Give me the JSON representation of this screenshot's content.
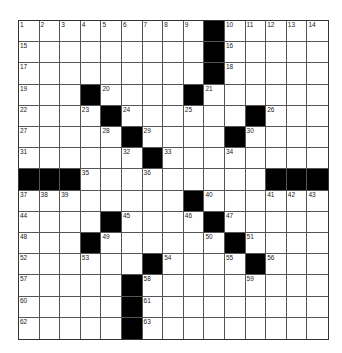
{
  "puzzle": {
    "rows": 15,
    "cols": 15,
    "colors": {
      "black": "#000000",
      "white": "#ffffff",
      "line": "#555555"
    },
    "black_cells": [
      [
        0,
        9
      ],
      [
        1,
        9
      ],
      [
        2,
        9
      ],
      [
        3,
        3
      ],
      [
        3,
        8
      ],
      [
        4,
        4
      ],
      [
        4,
        11
      ],
      [
        5,
        5
      ],
      [
        5,
        10
      ],
      [
        6,
        6
      ],
      [
        7,
        0
      ],
      [
        7,
        1
      ],
      [
        7,
        2
      ],
      [
        7,
        12
      ],
      [
        7,
        13
      ],
      [
        7,
        14
      ],
      [
        8,
        8
      ],
      [
        9,
        4
      ],
      [
        9,
        9
      ],
      [
        10,
        3
      ],
      [
        10,
        10
      ],
      [
        11,
        6
      ],
      [
        11,
        11
      ],
      [
        12,
        5
      ],
      [
        13,
        5
      ],
      [
        14,
        5
      ]
    ],
    "numbers": [
      [
        0,
        0,
        "1"
      ],
      [
        0,
        1,
        "2"
      ],
      [
        0,
        2,
        "3"
      ],
      [
        0,
        3,
        "4"
      ],
      [
        0,
        4,
        "5"
      ],
      [
        0,
        5,
        "6"
      ],
      [
        0,
        6,
        "7"
      ],
      [
        0,
        7,
        "8"
      ],
      [
        0,
        8,
        "9"
      ],
      [
        0,
        10,
        "10"
      ],
      [
        0,
        11,
        "11"
      ],
      [
        0,
        12,
        "12"
      ],
      [
        0,
        13,
        "13"
      ],
      [
        0,
        14,
        "14"
      ],
      [
        1,
        0,
        "15"
      ],
      [
        1,
        10,
        "16"
      ],
      [
        2,
        0,
        "17"
      ],
      [
        2,
        10,
        "18"
      ],
      [
        3,
        0,
        "19"
      ],
      [
        3,
        4,
        "20"
      ],
      [
        3,
        9,
        "21"
      ],
      [
        4,
        0,
        "22"
      ],
      [
        4,
        3,
        "23"
      ],
      [
        4,
        5,
        "24"
      ],
      [
        4,
        8,
        "25"
      ],
      [
        4,
        12,
        "26"
      ],
      [
        5,
        0,
        "27"
      ],
      [
        5,
        4,
        "28"
      ],
      [
        5,
        6,
        "29"
      ],
      [
        5,
        11,
        "30"
      ],
      [
        6,
        0,
        "31"
      ],
      [
        6,
        5,
        "32"
      ],
      [
        6,
        7,
        "33"
      ],
      [
        6,
        10,
        "34"
      ],
      [
        7,
        3,
        "35"
      ],
      [
        7,
        6,
        "36"
      ],
      [
        8,
        0,
        "37"
      ],
      [
        8,
        1,
        "38"
      ],
      [
        8,
        2,
        "39"
      ],
      [
        8,
        9,
        "40"
      ],
      [
        8,
        12,
        "41"
      ],
      [
        8,
        13,
        "42"
      ],
      [
        8,
        14,
        "43"
      ],
      [
        9,
        0,
        "44"
      ],
      [
        9,
        5,
        "45"
      ],
      [
        9,
        8,
        "46"
      ],
      [
        9,
        10,
        "47"
      ],
      [
        10,
        0,
        "48"
      ],
      [
        10,
        4,
        "49"
      ],
      [
        10,
        9,
        "50"
      ],
      [
        10,
        11,
        "51"
      ],
      [
        11,
        0,
        "52"
      ],
      [
        11,
        3,
        "53"
      ],
      [
        11,
        7,
        "54"
      ],
      [
        11,
        10,
        "55"
      ],
      [
        11,
        12,
        "56"
      ],
      [
        12,
        0,
        "57"
      ],
      [
        12,
        6,
        "58"
      ],
      [
        12,
        11,
        "59"
      ],
      [
        13,
        0,
        "60"
      ],
      [
        13,
        6,
        "61"
      ],
      [
        14,
        0,
        "62"
      ],
      [
        14,
        6,
        "63"
      ]
    ]
  }
}
